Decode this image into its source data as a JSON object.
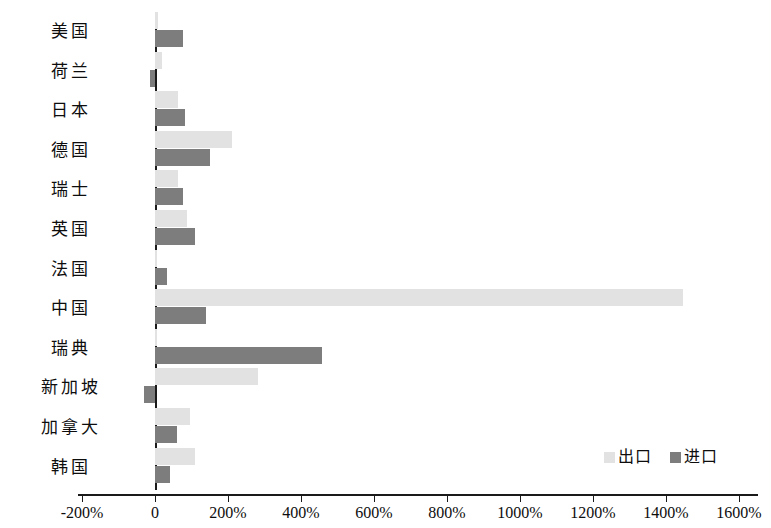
{
  "chart_data": {
    "type": "bar",
    "orientation": "horizontal",
    "title": "",
    "xlabel": "",
    "ylabel": "",
    "grid": false,
    "legend_position": "bottom-right",
    "xlim": [
      -200,
      1600
    ],
    "xticks": [
      -200,
      0,
      200,
      400,
      600,
      800,
      1000,
      1200,
      1400,
      1600
    ],
    "xtick_labels": [
      "-200%",
      "0",
      "200%",
      "400%",
      "600%",
      "800%",
      "1000%",
      "1200%",
      "1400%",
      "1600%"
    ],
    "categories": [
      "美国",
      "荷兰",
      "日本",
      "德国",
      "瑞士",
      "英国",
      "法国",
      "中国",
      "瑞典",
      "新加坡",
      "加拿大",
      "韩国"
    ],
    "series": [
      {
        "name": "出口",
        "color": "#e2e2e2",
        "values": [
          8,
          20,
          63,
          211,
          63,
          88,
          6,
          1447,
          5,
          282,
          96,
          110
        ]
      },
      {
        "name": "进口",
        "color": "#7d7d7d",
        "values": [
          77,
          -15,
          82,
          150,
          77,
          110,
          33,
          140,
          458,
          -30,
          60,
          41
        ]
      }
    ]
  },
  "legend": {
    "entries": [
      {
        "label": "出口",
        "color": "#e2e2e2"
      },
      {
        "label": "进口",
        "color": "#7d7d7d"
      }
    ]
  }
}
